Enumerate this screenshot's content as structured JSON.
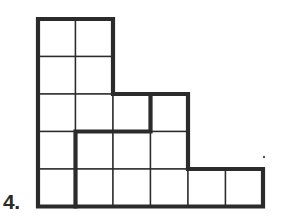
{
  "problem": {
    "number_label": "4."
  },
  "grid": {
    "cell_size": 37.5,
    "origin_x": 38,
    "origin_y": 19,
    "line_color": "#2b2b2b",
    "thin_width": 1.4,
    "thick_width": 4.2,
    "cells": [
      [
        0,
        0
      ],
      [
        1,
        0
      ],
      [
        0,
        1
      ],
      [
        1,
        1
      ],
      [
        0,
        2
      ],
      [
        1,
        2
      ],
      [
        2,
        2
      ],
      [
        3,
        2
      ],
      [
        0,
        3
      ],
      [
        1,
        3
      ],
      [
        2,
        3
      ],
      [
        3,
        3
      ],
      [
        0,
        4
      ],
      [
        1,
        4
      ],
      [
        2,
        4
      ],
      [
        3,
        4
      ],
      [
        4,
        4
      ],
      [
        5,
        4
      ]
    ],
    "outline_path": [
      [
        0,
        0
      ],
      [
        2,
        0
      ],
      [
        2,
        2
      ],
      [
        4,
        2
      ],
      [
        4,
        4
      ],
      [
        6,
        4
      ],
      [
        6,
        5
      ],
      [
        0,
        5
      ],
      [
        0,
        0
      ]
    ],
    "inner_thick_path": [
      [
        3,
        2
      ],
      [
        3,
        3
      ],
      [
        1,
        3
      ],
      [
        1,
        5
      ]
    ]
  },
  "marks": {
    "dot": {
      "x": 264,
      "y": 157
    }
  }
}
